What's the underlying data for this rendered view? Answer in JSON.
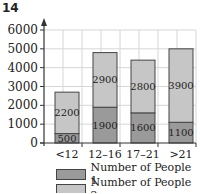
{
  "figure_number": "14",
  "colors": {
    "series1": "#9a9a9a",
    "series2": "#c6c6c6",
    "grid": "#d6d6d6",
    "axis": "#333333"
  },
  "chart_data": {
    "type": "bar",
    "stacked": true,
    "title": "",
    "xlabel": "",
    "ylabel": "",
    "categories": [
      "<12",
      "12–16",
      "17–21",
      ">21"
    ],
    "series": [
      {
        "name": "Number of People 1",
        "values": [
          500,
          1900,
          1600,
          1100
        ]
      },
      {
        "name": "Number of People 2",
        "values": [
          2200,
          2900,
          2800,
          3900
        ]
      }
    ],
    "yticks": [
      0,
      1000,
      2000,
      3000,
      4000,
      5000,
      6000
    ],
    "ylim": [
      0,
      6000
    ],
    "grid": true,
    "legend_position": "bottom"
  },
  "legend": {
    "items": [
      "Number of People 1",
      "Number of People 2"
    ]
  }
}
